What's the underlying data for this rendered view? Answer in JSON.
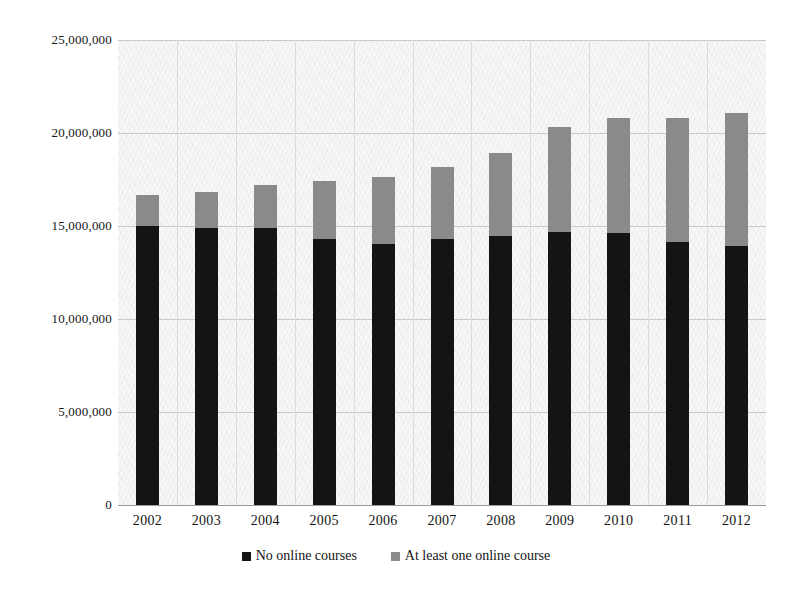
{
  "chart_data": {
    "type": "bar",
    "subtype": "stacked-column",
    "title": "",
    "xlabel": "",
    "ylabel": "",
    "categories": [
      "2002",
      "2003",
      "2004",
      "2005",
      "2006",
      "2007",
      "2008",
      "2009",
      "2010",
      "2011",
      "2012"
    ],
    "series": [
      {
        "name": "No online courses",
        "color": "#141414",
        "values": [
          15000000,
          14900000,
          14900000,
          14300000,
          14050000,
          14300000,
          14450000,
          14700000,
          14650000,
          14150000,
          13900000
        ]
      },
      {
        "name": "At least one online course",
        "color": "#8a8a8a",
        "values": [
          1650000,
          1950000,
          2300000,
          3100000,
          3600000,
          3850000,
          4500000,
          5600000,
          6150000,
          6650000,
          7150000
        ]
      }
    ],
    "totals": [
      16650000,
      16850000,
      17200000,
      17400000,
      17650000,
      18150000,
      18950000,
      20300000,
      20800000,
      20800000,
      21050000
    ],
    "ylim": [
      0,
      25000000
    ],
    "ytick_values": [
      0,
      5000000,
      10000000,
      15000000,
      20000000,
      25000000
    ],
    "ytick_labels": [
      "0",
      "5,000,000",
      "10,000,000",
      "15,000,000",
      "20,000,000",
      "25,000,000"
    ],
    "grid": true,
    "legend_position": "bottom",
    "legend": [
      {
        "label": "No online courses",
        "marker": "square",
        "color": "#141414"
      },
      {
        "label": "At least one online course",
        "marker": "square",
        "color": "#8a8a8a"
      }
    ]
  },
  "colors": {
    "series_bottom": "#141414",
    "series_top": "#8a8a8a",
    "plot_background": "#f7f7f6",
    "gridline": "#c9c9c9",
    "axis": "#9a9a9a",
    "text": "#141414"
  }
}
